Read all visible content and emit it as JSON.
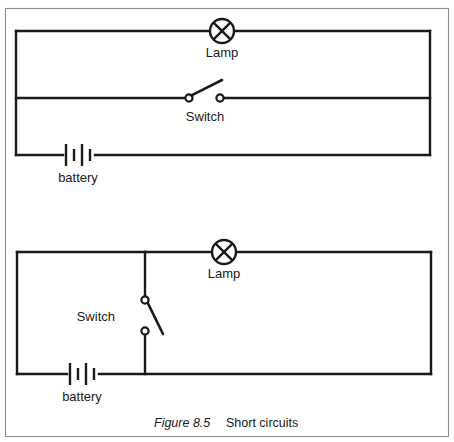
{
  "figure": {
    "caption_figure_number": "Figure 8.5",
    "caption_title": "Short circuits",
    "border_color": "#8e8e8e",
    "ink_color": "#1a1a1a",
    "background_color": "#ffffff"
  },
  "circuits": [
    {
      "id": "top-circuit",
      "description": "Short circuit with switch wire bypassing the lamp",
      "components": [
        {
          "type": "lamp",
          "icon": "lamp-icon",
          "label": "Lamp"
        },
        {
          "type": "switch",
          "icon": "switch-open-icon",
          "label": "Switch",
          "state": "open"
        },
        {
          "type": "battery",
          "icon": "battery-icon",
          "label": "battery",
          "cells": 2
        }
      ]
    },
    {
      "id": "bottom-circuit",
      "description": "Short circuit with switch on a vertical branch across the battery",
      "components": [
        {
          "type": "lamp",
          "icon": "lamp-icon",
          "label": "Lamp"
        },
        {
          "type": "switch",
          "icon": "switch-open-icon",
          "label": "Switch",
          "state": "open"
        },
        {
          "type": "battery",
          "icon": "battery-icon",
          "label": "battery",
          "cells": 2
        }
      ]
    }
  ],
  "labels": {
    "lamp_top": "Lamp",
    "switch_top": "Switch",
    "battery_top": "battery",
    "lamp_bottom": "Lamp",
    "switch_bottom": "Switch",
    "battery_bottom": "battery"
  }
}
